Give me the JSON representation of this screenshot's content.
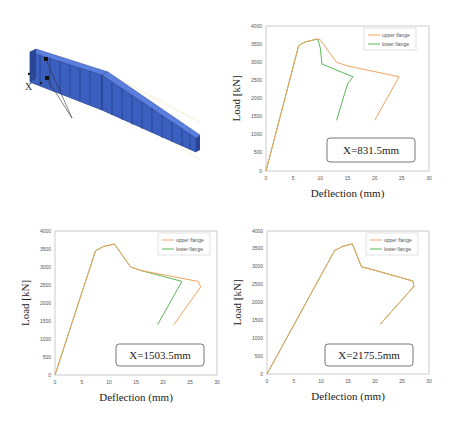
{
  "figure": {
    "model_label": "X",
    "beam_color": "#3a5fbf"
  },
  "colors": {
    "upper_flange": "#f4a460",
    "lower_flange": "#5cb85c",
    "axis": "#bfbfbf",
    "box_border": "#555555"
  },
  "chart_data": [
    {
      "type": "line",
      "title": "",
      "annotation": "X=831.5mm",
      "xlabel": "Deflection (mm)",
      "ylabel": "Load [kN]",
      "xlim": [
        0,
        30
      ],
      "ylim": [
        0,
        4000
      ],
      "xticks": [
        0,
        5,
        10,
        15,
        20,
        25,
        30
      ],
      "yticks": [
        0,
        500,
        1000,
        1500,
        2000,
        2500,
        3000,
        3500,
        4000
      ],
      "grid": false,
      "legend_position": "upper right",
      "series": [
        {
          "name": "upper flange",
          "color": "#f4a460",
          "x": [
            0,
            6,
            7,
            9.3,
            10,
            13,
            15,
            24.5,
            20
          ],
          "y": [
            0,
            3450,
            3550,
            3640,
            3620,
            3000,
            2900,
            2600,
            1400
          ]
        },
        {
          "name": "lower flange",
          "color": "#5cb85c",
          "x": [
            0,
            6,
            7,
            9.5,
            10,
            10.3,
            16,
            15,
            13
          ],
          "y": [
            0,
            3450,
            3550,
            3640,
            3400,
            2950,
            2600,
            2400,
            1400
          ]
        }
      ]
    },
    {
      "type": "line",
      "title": "",
      "annotation": "X=1503.5mm",
      "xlabel": "Deflection (mm)",
      "ylabel": "Load [kN]",
      "xlim": [
        0,
        30
      ],
      "ylim": [
        0,
        4000
      ],
      "xticks": [
        0,
        5,
        10,
        15,
        20,
        25,
        30
      ],
      "yticks": [
        0,
        500,
        1000,
        1500,
        2000,
        2500,
        3000,
        3500,
        4000
      ],
      "grid": false,
      "legend_position": "upper right",
      "series": [
        {
          "name": "upper flange",
          "color": "#f4a460",
          "x": [
            0,
            7.5,
            9,
            11,
            14,
            16,
            26.5,
            27,
            22
          ],
          "y": [
            0,
            3450,
            3570,
            3640,
            3000,
            2900,
            2600,
            2450,
            1400
          ]
        },
        {
          "name": "lower flange",
          "color": "#5cb85c",
          "x": [
            0,
            7.5,
            9,
            11,
            14,
            16,
            23.5,
            19
          ],
          "y": [
            0,
            3450,
            3570,
            3640,
            3000,
            2900,
            2600,
            1400
          ]
        }
      ]
    },
    {
      "type": "line",
      "title": "",
      "annotation": "X=2175.5mm",
      "xlabel": "Deflection (mm)",
      "ylabel": "Load [kN]",
      "xlim": [
        0,
        30
      ],
      "ylim": [
        0,
        4000
      ],
      "xticks": [
        0,
        5,
        10,
        15,
        20,
        25,
        30
      ],
      "yticks": [
        0,
        500,
        1000,
        1500,
        2000,
        2500,
        3000,
        3500,
        4000
      ],
      "grid": false,
      "legend_position": "upper right",
      "series": [
        {
          "name": "upper flange",
          "color": "#f4a460",
          "x": [
            0,
            12.5,
            14,
            15.8,
            17.5,
            20,
            27,
            27.2,
            21
          ],
          "y": [
            0,
            3450,
            3570,
            3640,
            3000,
            2900,
            2600,
            2450,
            1400
          ]
        },
        {
          "name": "lower flange",
          "color": "#5cb85c",
          "x": [
            0,
            12.5,
            14,
            15.8,
            17.5,
            20,
            27,
            27.2,
            21
          ],
          "y": [
            0,
            3450,
            3570,
            3640,
            3000,
            2900,
            2600,
            2450,
            1400
          ]
        }
      ]
    }
  ]
}
